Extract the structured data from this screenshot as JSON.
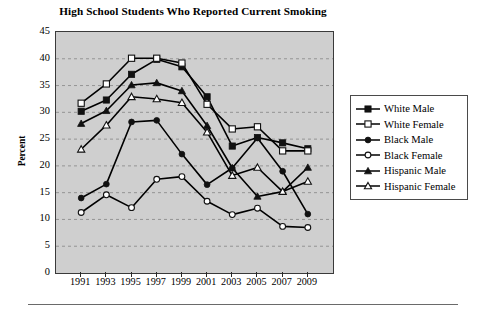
{
  "chart_data": {
    "type": "line",
    "title": "High School Students Who Reported Current Smoking",
    "xlabel": "",
    "ylabel": "Percent",
    "ylim": [
      0,
      45
    ],
    "yticks": [
      0,
      5,
      10,
      15,
      20,
      25,
      30,
      35,
      40,
      45
    ],
    "grid": true,
    "grid_axis": "y",
    "legend_position": "right-outside",
    "plot_background": "#cfcfcf",
    "line_color": "#000000",
    "categories": [
      1991,
      1993,
      1995,
      1997,
      1999,
      2001,
      2003,
      2005,
      2007,
      2009
    ],
    "tick_labels": [
      "1991",
      "1993",
      "1995",
      "1997",
      "1999",
      "2001",
      "2003",
      "2005",
      "2007",
      "2009"
    ],
    "series": [
      {
        "name": "White Male",
        "marker": "filled-square",
        "values": [
          30.2,
          32.3,
          37.1,
          39.9,
          38.5,
          32.9,
          23.7,
          25.3,
          24.3,
          23.2
        ]
      },
      {
        "name": "White Female",
        "marker": "open-square",
        "values": [
          31.7,
          35.3,
          40.1,
          40.1,
          39.2,
          31.5,
          26.9,
          27.3,
          22.8,
          22.8
        ]
      },
      {
        "name": "Black Male",
        "marker": "filled-circle",
        "values": [
          14.0,
          16.6,
          28.2,
          28.5,
          22.2,
          16.5,
          19.6,
          25.2,
          19.0,
          11.0
        ]
      },
      {
        "name": "Black Female",
        "marker": "open-circle",
        "values": [
          11.3,
          14.6,
          12.2,
          17.5,
          18.0,
          13.4,
          10.9,
          12.1,
          8.7,
          8.5
        ]
      },
      {
        "name": "Hispanic Male",
        "marker": "filled-triangle",
        "values": [
          27.9,
          30.3,
          35.1,
          35.5,
          34.0,
          27.5,
          19.6,
          14.3,
          15.2,
          19.7
        ]
      },
      {
        "name": "Hispanic Female",
        "marker": "open-triangle",
        "values": [
          23.1,
          27.6,
          32.9,
          32.5,
          31.8,
          26.3,
          18.2,
          19.7,
          15.2,
          17.1
        ]
      }
    ]
  }
}
